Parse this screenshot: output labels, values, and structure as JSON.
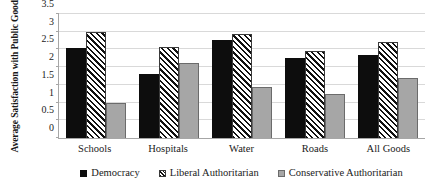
{
  "chart_data": {
    "type": "bar",
    "title": "",
    "xlabel": "",
    "ylabel": "Average Satisfaction with Public Goods",
    "ylim": [
      0,
      3.5
    ],
    "yticks": [
      "0",
      "0.5",
      "1",
      "1.5",
      "2",
      "2.5",
      "3",
      "3.5"
    ],
    "ytick_values": [
      0,
      0.5,
      1,
      1.5,
      2,
      2.5,
      3,
      3.5
    ],
    "grid": true,
    "legend_position": "bottom",
    "categories": [
      "Schools",
      "Hospitals",
      "Water",
      "Roads",
      "All Goods"
    ],
    "series": [
      {
        "name": "Democracy",
        "color": "#0d0d0d",
        "pattern": "solid-black",
        "values": [
          2.55,
          1.82,
          2.78,
          2.25,
          2.33
        ]
      },
      {
        "name": "Liberal Authoritarian",
        "color": "#111111",
        "pattern": "diagonal-hatch",
        "values": [
          3.0,
          2.58,
          2.93,
          2.45,
          2.7
        ]
      },
      {
        "name": "Conservative Authoritarian",
        "color": "#a6a6a6",
        "pattern": "solid-gray",
        "values": [
          0.98,
          2.13,
          1.45,
          1.25,
          1.68
        ]
      }
    ]
  }
}
